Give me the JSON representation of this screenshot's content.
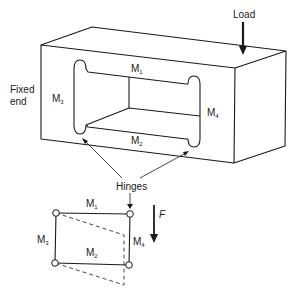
{
  "figure": {
    "type": "mechanical-schematic"
  },
  "labels": {
    "load": "Load",
    "fixed_end_line1": "Fixed",
    "fixed_end_line2": "end",
    "hinges": "Hinges",
    "force": "F"
  },
  "members": {
    "m1": {
      "base": "M",
      "sub": "1"
    },
    "m2": {
      "base": "M",
      "sub": "2"
    },
    "m3": {
      "base": "M",
      "sub": "3"
    },
    "m4": {
      "base": "M",
      "sub": "4"
    }
  },
  "schematic": {
    "hinge_count": 4,
    "deformed_shape": "dashed parallelogram (M4 side displaced downward by F)"
  },
  "colors": {
    "line": "#1a1a1a",
    "background": "#ffffff"
  }
}
